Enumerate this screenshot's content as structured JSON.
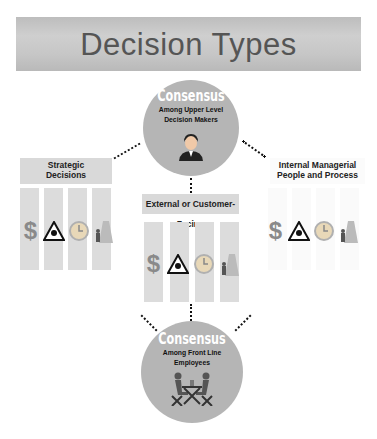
{
  "title": "Decision Types",
  "top_circle": {
    "title": "Consensus",
    "subtitle_line1": "Among Upper Level",
    "subtitle_line2": "Decision Makers",
    "icon": "businessman-icon"
  },
  "bottom_circle": {
    "title": "Consensus",
    "subtitle_line1": "Among Front Line",
    "subtitle_line2": "Employees",
    "icon": "meeting-table-icon"
  },
  "left_box": {
    "line1": "Strategic",
    "line2": "Decisions"
  },
  "center_box": {
    "line1": "External or Customer-Facing"
  },
  "right_box": {
    "line1": "Internal Managerial",
    "line2": "People and Process"
  },
  "pillar_icons": [
    "dollar-icon",
    "hazard-icon",
    "clock-icon",
    "road-person-icon"
  ],
  "dollar_glyph": "$"
}
